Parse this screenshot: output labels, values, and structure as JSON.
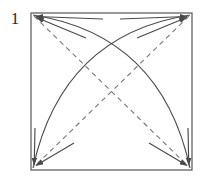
{
  "figure": {
    "step_number": "1",
    "caption": "",
    "type": "origami-fold-diagram",
    "background_color": "#ffffff"
  },
  "colors": {
    "paper_outline": "#555555",
    "valley_crease_dashed": "#777777",
    "fold_arc_solid": "#4a4a4a",
    "arrow_stroke": "#4a4a4a",
    "label_text": "#2b2b2b"
  },
  "canvas": {
    "width": 211,
    "height": 183
  },
  "shapes": {
    "paper_square": {
      "name": "paper-square",
      "x": 31,
      "y": 13,
      "width": 161,
      "height": 157,
      "stroke_width": 1.2
    },
    "corners": {
      "top_left": {
        "x": 31,
        "y": 13
      },
      "top_right": {
        "x": 192,
        "y": 13
      },
      "bottom_left": {
        "x": 31,
        "y": 170
      },
      "bottom_right": {
        "x": 192,
        "y": 170
      },
      "center": {
        "x": 111.5,
        "y": 91.5
      }
    },
    "dashed_creases": [
      {
        "name": "diagonal-crease-tl-br",
        "from": {
          "x": 34,
          "y": 16
        },
        "to": {
          "x": 189,
          "y": 167
        },
        "style": "dashed",
        "dash_pattern": "5 4"
      },
      {
        "name": "diagonal-crease-tr-bl",
        "from": {
          "x": 189,
          "y": 16
        },
        "to": {
          "x": 34,
          "y": 167
        },
        "style": "dashed",
        "dash_pattern": "5 4"
      }
    ],
    "solid_arcs": [
      {
        "name": "fold-arc-bl-to-tr",
        "from": {
          "x": 33,
          "y": 168
        },
        "control": {
          "x": 62,
          "y": 35
        },
        "to": {
          "x": 190,
          "y": 15
        },
        "style": "solid",
        "bulge": "upper-left"
      },
      {
        "name": "fold-arc-br-to-tl",
        "from": {
          "x": 190,
          "y": 168
        },
        "control": {
          "x": 161,
          "y": 35
        },
        "to": {
          "x": 33,
          "y": 15
        },
        "style": "solid",
        "bulge": "upper-right"
      }
    ],
    "corner_arrows": [
      {
        "name": "arrow-to-top-left-upper",
        "from": {
          "x": 103,
          "y": 19
        },
        "to": {
          "x": 34,
          "y": 16
        }
      },
      {
        "name": "arrow-to-top-left-lower",
        "from": {
          "x": 86,
          "y": 38
        },
        "to": {
          "x": 34,
          "y": 16
        }
      },
      {
        "name": "arrow-to-top-right-upper",
        "from": {
          "x": 120,
          "y": 19
        },
        "to": {
          "x": 189,
          "y": 16
        }
      },
      {
        "name": "arrow-to-top-right-lower",
        "from": {
          "x": 137,
          "y": 38
        },
        "to": {
          "x": 189,
          "y": 16
        }
      },
      {
        "name": "arrow-to-bottom-left-vert",
        "from": {
          "x": 35,
          "y": 128
        },
        "to": {
          "x": 34,
          "y": 167
        }
      },
      {
        "name": "arrow-to-bottom-left-diag",
        "from": {
          "x": 74,
          "y": 143
        },
        "to": {
          "x": 34,
          "y": 167
        }
      },
      {
        "name": "arrow-to-bottom-right-vert",
        "from": {
          "x": 188,
          "y": 128
        },
        "to": {
          "x": 189,
          "y": 167
        }
      },
      {
        "name": "arrow-to-bottom-right-diag",
        "from": {
          "x": 149,
          "y": 143
        },
        "to": {
          "x": 189,
          "y": 167
        }
      }
    ]
  }
}
